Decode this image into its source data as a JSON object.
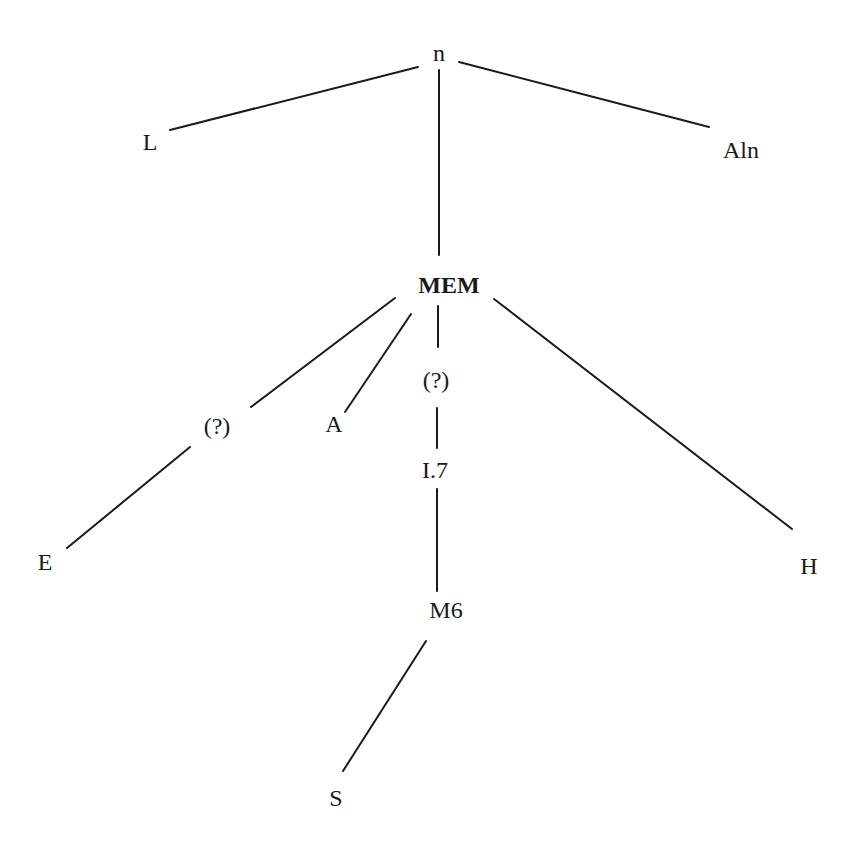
{
  "diagram": {
    "type": "tree",
    "nodes": [
      {
        "id": "n",
        "label": "n",
        "bold": false
      },
      {
        "id": "L",
        "label": "L",
        "bold": false
      },
      {
        "id": "Aln",
        "label": "Aln",
        "bold": false
      },
      {
        "id": "MEM",
        "label": "MEM",
        "bold": true
      },
      {
        "id": "q1",
        "label": "(?)",
        "bold": false
      },
      {
        "id": "A",
        "label": "A",
        "bold": false
      },
      {
        "id": "q2",
        "label": "(?)",
        "bold": false
      },
      {
        "id": "I7",
        "label": "I.7",
        "bold": false
      },
      {
        "id": "E",
        "label": "E",
        "bold": false
      },
      {
        "id": "H",
        "label": "H",
        "bold": false
      },
      {
        "id": "M6",
        "label": "M6",
        "bold": false
      },
      {
        "id": "S",
        "label": "S",
        "bold": false
      }
    ],
    "edges": [
      {
        "from": "n",
        "to": "L"
      },
      {
        "from": "n",
        "to": "Aln"
      },
      {
        "from": "n",
        "to": "MEM"
      },
      {
        "from": "MEM",
        "to": "q1"
      },
      {
        "from": "MEM",
        "to": "A"
      },
      {
        "from": "MEM",
        "to": "q2"
      },
      {
        "from": "MEM",
        "to": "H"
      },
      {
        "from": "q1",
        "to": "E"
      },
      {
        "from": "q2",
        "to": "I7"
      },
      {
        "from": "I7",
        "to": "M6"
      },
      {
        "from": "M6",
        "to": "S"
      }
    ]
  }
}
